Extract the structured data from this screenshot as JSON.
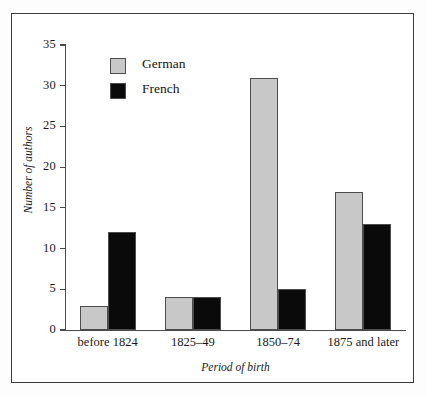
{
  "chart_data": {
    "type": "bar",
    "title": "",
    "xlabel": "Period of birth",
    "ylabel": "Number of authors",
    "categories": [
      "before 1824",
      "1825–49",
      "1850–74",
      "1875 and later"
    ],
    "series": [
      {
        "name": "German",
        "color": "#c8c8c8",
        "values": [
          3,
          4,
          31,
          17
        ]
      },
      {
        "name": "French",
        "color": "#0a0a0a",
        "values": [
          12,
          4,
          5,
          13
        ]
      }
    ],
    "ylim": [
      0,
      35
    ],
    "ytick_step": 5,
    "yticks": [
      0,
      5,
      10,
      15,
      20,
      25,
      30,
      35
    ],
    "ytick_labels": [
      "0",
      "5",
      "10",
      "15",
      "20",
      "25",
      "30",
      "35"
    ],
    "grid": false,
    "legend_position": "upper-left-inside",
    "bar_outline_color": "#4d4d4d",
    "axis_color": "#4a4a4a",
    "frame_color": "#3a3a3a"
  }
}
